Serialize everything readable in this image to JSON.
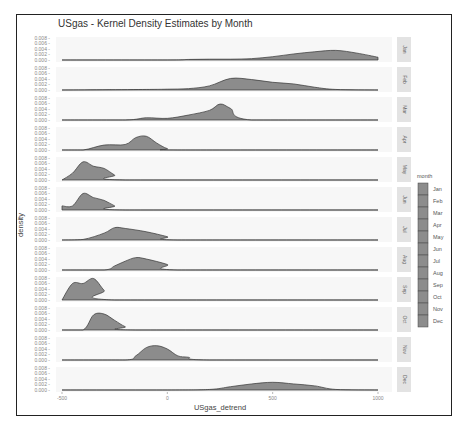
{
  "chart_data": {
    "type": "area",
    "title": "USgas - Kernel Density Estimates by Month",
    "xlabel": "USgas_detrend",
    "ylabel": "density",
    "x_ticks": [
      -500,
      0,
      500,
      1000
    ],
    "x_tick_labels": [
      "-500",
      "0",
      "500",
      "1000"
    ],
    "y_ticks": [
      0.0,
      0.002,
      0.004,
      0.006,
      0.008
    ],
    "y_tick_labels": [
      "0.000",
      "0.002",
      "0.004",
      "0.006",
      "0.008"
    ],
    "xlim": [
      -500,
      1000
    ],
    "ylim": [
      0,
      0.008
    ],
    "facet": "month",
    "legend": {
      "title": "month",
      "position": "right",
      "entries": [
        "Jan",
        "Feb",
        "Mar",
        "Apr",
        "May",
        "Jun",
        "Jul",
        "Aug",
        "Sep",
        "Oct",
        "Nov",
        "Dec"
      ]
    },
    "fill_color": "#8c8c8c",
    "series": [
      {
        "name": "Jan",
        "x": [
          -500,
          0,
          100,
          200,
          300,
          400,
          500,
          600,
          700,
          800,
          900,
          1000
        ],
        "values": [
          0,
          0,
          0.0002,
          0.0003,
          0.0003,
          0.0005,
          0.0012,
          0.0022,
          0.003,
          0.0035,
          0.0025,
          0.001
        ]
      },
      {
        "name": "Feb",
        "x": [
          -500,
          -100,
          0,
          100,
          200,
          300,
          400,
          500,
          600,
          700,
          800,
          1000
        ],
        "values": [
          0,
          0.0002,
          0.0003,
          0.0005,
          0.0015,
          0.0042,
          0.0038,
          0.0028,
          0.0022,
          0.001,
          0.0002,
          0
        ]
      },
      {
        "name": "Mar",
        "x": [
          -500,
          -200,
          -100,
          0,
          100,
          200,
          250,
          300,
          400,
          1000
        ],
        "values": [
          0,
          0,
          0.0008,
          0.0006,
          0.0018,
          0.0035,
          0.0058,
          0.0042,
          0,
          0
        ]
      },
      {
        "name": "Apr",
        "x": [
          -500,
          -400,
          -300,
          -200,
          -150,
          -100,
          -50,
          0,
          50,
          1000
        ],
        "values": [
          0,
          0,
          0.0018,
          0.002,
          0.0045,
          0.005,
          0.0025,
          0.0005,
          0,
          0
        ]
      },
      {
        "name": "May",
        "x": [
          -500,
          -450,
          -400,
          -350,
          -300,
          -250,
          -200,
          1000
        ],
        "values": [
          0,
          0.0025,
          0.0066,
          0.005,
          0.0042,
          0.0018,
          0,
          0
        ]
      },
      {
        "name": "Jun",
        "x": [
          -500,
          -450,
          -400,
          -350,
          -300,
          -250,
          -200,
          1000
        ],
        "values": [
          0.0015,
          0.0015,
          0.006,
          0.0045,
          0.0035,
          0.0015,
          0,
          0
        ]
      },
      {
        "name": "Jul",
        "x": [
          -500,
          -400,
          -300,
          -250,
          -200,
          -100,
          0,
          50,
          1000
        ],
        "values": [
          0,
          0.0002,
          0.0025,
          0.0045,
          0.0042,
          0.003,
          0.0012,
          0,
          0
        ]
      },
      {
        "name": "Aug",
        "x": [
          -500,
          -300,
          -250,
          -200,
          -150,
          -100,
          0,
          50,
          1000
        ],
        "values": [
          0,
          0,
          0.0015,
          0.0032,
          0.0045,
          0.004,
          0.002,
          0,
          0
        ]
      },
      {
        "name": "Sep",
        "x": [
          -500,
          -450,
          -400,
          -350,
          -300,
          -250,
          1000
        ],
        "values": [
          0,
          0.006,
          0.006,
          0.0078,
          0.0035,
          0,
          0
        ]
      },
      {
        "name": "Oct",
        "x": [
          -500,
          -400,
          -350,
          -300,
          -250,
          -200,
          -150,
          1000
        ],
        "values": [
          0,
          0,
          0.0055,
          0.0058,
          0.0035,
          0.0012,
          0,
          0
        ]
      },
      {
        "name": "Nov",
        "x": [
          -500,
          -200,
          -150,
          -100,
          -50,
          0,
          50,
          100,
          200,
          1000
        ],
        "values": [
          0,
          0,
          0.0015,
          0.0045,
          0.0052,
          0.004,
          0.0015,
          0.001,
          0,
          0
        ]
      },
      {
        "name": "Dec",
        "x": [
          -500,
          0,
          200,
          300,
          400,
          500,
          600,
          700,
          800,
          1000
        ],
        "values": [
          0,
          0,
          0.0002,
          0.0012,
          0.0022,
          0.0028,
          0.0022,
          0.0015,
          0.0002,
          0
        ]
      }
    ]
  }
}
